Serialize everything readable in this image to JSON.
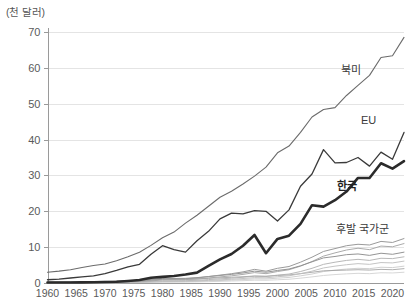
{
  "chart_data": {
    "type": "line",
    "title": "",
    "subtitle": "",
    "xlabel": "",
    "ylabel": "(천 달러)",
    "unit_note": "(천 달러)",
    "grid": true,
    "legend_position": "inline-annotations",
    "xlim": [
      1960,
      2022
    ],
    "ylim": [
      0,
      70
    ],
    "xticks": [
      1960,
      1965,
      1970,
      1975,
      1980,
      1985,
      1990,
      1995,
      2000,
      2005,
      2010,
      2015,
      2020
    ],
    "xtick_labels": [
      "1960",
      "1965",
      "1970",
      "1975",
      "1980",
      "1985",
      "1990",
      "1995",
      "2000",
      "2005",
      "2010",
      "2015",
      "2020"
    ],
    "yticks": [
      0,
      10,
      20,
      30,
      40,
      50,
      60,
      70
    ],
    "ytick_labels": [
      "0",
      "10",
      "20",
      "30",
      "40",
      "50",
      "60",
      "70"
    ],
    "x": [
      1960,
      1962,
      1964,
      1966,
      1968,
      1970,
      1972,
      1974,
      1976,
      1978,
      1980,
      1982,
      1984,
      1986,
      1988,
      1990,
      1992,
      1994,
      1996,
      1998,
      2000,
      2002,
      2004,
      2006,
      2008,
      2010,
      2012,
      2014,
      2016,
      2018,
      2020,
      2022
    ],
    "series": [
      {
        "name": "북미",
        "label": "북미",
        "color": "#6b6b6b",
        "width": 1.1,
        "style": "thin",
        "values": [
          3.0,
          3.3,
          3.7,
          4.3,
          4.9,
          5.3,
          6.2,
          7.3,
          8.6,
          10.5,
          12.6,
          14.2,
          16.7,
          18.9,
          21.4,
          23.9,
          25.6,
          27.6,
          29.8,
          32.3,
          36.3,
          38.2,
          42.0,
          46.3,
          48.4,
          48.9,
          52.3,
          55.1,
          57.9,
          62.9,
          63.4,
          68.5
        ]
      },
      {
        "name": "EU",
        "label": "EU",
        "color": "#3a3a3a",
        "width": 1.3,
        "style": "thin-dark",
        "values": [
          0.9,
          1.1,
          1.4,
          1.7,
          2.0,
          2.6,
          3.5,
          4.5,
          5.2,
          8.0,
          10.4,
          9.3,
          8.6,
          11.8,
          14.4,
          17.9,
          19.5,
          19.3,
          20.2,
          20.0,
          17.3,
          20.4,
          27.0,
          30.4,
          37.2,
          33.5,
          33.6,
          35.0,
          32.6,
          36.5,
          34.5,
          42.0
        ]
      },
      {
        "name": "한국",
        "label": "한국",
        "color": "#2b2b2b",
        "width": 2.6,
        "style": "bold",
        "values": [
          0.16,
          0.12,
          0.13,
          0.17,
          0.22,
          0.28,
          0.34,
          0.57,
          0.85,
          1.45,
          1.72,
          1.95,
          2.35,
          2.9,
          4.8,
          6.6,
          8.1,
          10.4,
          13.4,
          8.3,
          12.3,
          13.2,
          16.5,
          21.7,
          21.3,
          23.1,
          25.5,
          29.3,
          29.3,
          33.4,
          31.9,
          34.0
        ]
      },
      {
        "name": "후발 국가군",
        "label": "후발 국가군",
        "color": "#9a9a9a",
        "width": 1.0,
        "style": "thin-light",
        "values": [
          0.12,
          0.13,
          0.14,
          0.16,
          0.18,
          0.22,
          0.29,
          0.42,
          0.55,
          0.78,
          1.05,
          1.1,
          1.2,
          1.4,
          1.8,
          2.2,
          2.6,
          3.1,
          3.8,
          3.3,
          4.1,
          4.6,
          5.8,
          7.2,
          8.8,
          9.6,
          10.4,
          10.8,
          10.6,
          11.6,
          11.3,
          12.4
        ]
      },
      {
        "name": "후발 국가군 2",
        "label": "",
        "color": "#a5a5a5",
        "width": 0.95,
        "style": "thin-light",
        "values": [
          0.1,
          0.11,
          0.12,
          0.13,
          0.15,
          0.18,
          0.23,
          0.31,
          0.42,
          0.6,
          0.82,
          0.88,
          0.95,
          1.1,
          1.4,
          1.7,
          2.0,
          2.4,
          2.9,
          2.6,
          3.2,
          3.7,
          4.7,
          6.0,
          7.5,
          8.4,
          9.2,
          9.7,
          9.3,
          10.3,
          10.1,
          11.0
        ]
      },
      {
        "name": "후발 국가군 3",
        "label": "",
        "color": "#8e8e8e",
        "width": 0.95,
        "style": "thin-light",
        "values": [
          0.2,
          0.21,
          0.23,
          0.26,
          0.3,
          0.36,
          0.45,
          0.6,
          0.78,
          1.0,
          1.3,
          1.25,
          1.3,
          1.5,
          1.8,
          2.1,
          2.4,
          2.8,
          3.3,
          3.0,
          3.5,
          3.9,
          4.8,
          5.9,
          7.0,
          7.4,
          7.9,
          8.1,
          7.7,
          8.3,
          8.0,
          8.6
        ]
      },
      {
        "name": "후발 국가군 4",
        "label": "",
        "color": "#b0b0b0",
        "width": 0.9,
        "style": "thin-light",
        "values": [
          0.08,
          0.09,
          0.1,
          0.11,
          0.12,
          0.14,
          0.17,
          0.22,
          0.3,
          0.42,
          0.56,
          0.6,
          0.65,
          0.75,
          0.95,
          1.15,
          1.35,
          1.6,
          1.9,
          1.8,
          2.2,
          2.5,
          3.2,
          4.1,
          5.2,
          5.8,
          6.3,
          6.6,
          6.3,
          6.9,
          6.8,
          7.3
        ]
      },
      {
        "name": "후발 국가군 5",
        "label": "",
        "color": "#bdbdbd",
        "width": 0.9,
        "style": "thin-light",
        "values": [
          0.06,
          0.07,
          0.08,
          0.09,
          0.1,
          0.12,
          0.14,
          0.18,
          0.24,
          0.32,
          0.42,
          0.45,
          0.5,
          0.58,
          0.72,
          0.88,
          1.05,
          1.25,
          1.5,
          1.45,
          1.75,
          2.0,
          2.6,
          3.3,
          4.2,
          4.7,
          5.1,
          5.4,
          5.2,
          5.7,
          5.6,
          6.1
        ]
      },
      {
        "name": "후발 국가군 6",
        "label": "",
        "color": "#c8c8c8",
        "width": 0.85,
        "style": "thin-light",
        "values": [
          0.05,
          0.05,
          0.06,
          0.07,
          0.08,
          0.09,
          0.11,
          0.14,
          0.18,
          0.24,
          0.31,
          0.34,
          0.38,
          0.44,
          0.55,
          0.68,
          0.8,
          0.95,
          1.15,
          1.12,
          1.35,
          1.55,
          2.0,
          2.5,
          3.2,
          3.6,
          3.9,
          4.1,
          4.0,
          4.4,
          4.3,
          4.7
        ]
      },
      {
        "name": "후발 국가군 7",
        "label": "",
        "color": "#9f9f9f",
        "width": 0.85,
        "style": "thin-light",
        "values": [
          0.3,
          0.32,
          0.34,
          0.37,
          0.4,
          0.45,
          0.52,
          0.62,
          0.74,
          0.9,
          1.08,
          1.05,
          1.06,
          1.15,
          1.3,
          1.45,
          1.6,
          1.75,
          1.95,
          1.9,
          2.1,
          2.25,
          2.6,
          3.0,
          3.4,
          3.5,
          3.6,
          3.7,
          3.6,
          3.8,
          3.7,
          4.0
        ]
      },
      {
        "name": "후발 국가군 8",
        "label": "",
        "color": "#d0d0d0",
        "width": 0.85,
        "style": "thin-light",
        "values": [
          0.04,
          0.04,
          0.05,
          0.05,
          0.06,
          0.07,
          0.08,
          0.1,
          0.13,
          0.17,
          0.22,
          0.24,
          0.26,
          0.3,
          0.38,
          0.46,
          0.55,
          0.65,
          0.78,
          0.76,
          0.9,
          1.05,
          1.35,
          1.7,
          2.1,
          2.35,
          2.55,
          2.7,
          2.6,
          2.85,
          2.8,
          3.0
        ]
      }
    ],
    "annotations": [
      {
        "text": "북미",
        "x_px": 341,
        "y_px": 74,
        "bold": false
      },
      {
        "text": "EU",
        "x_px": 361,
        "y_px": 124,
        "bold": false
      },
      {
        "text": "한국",
        "x_px": 337,
        "y_px": 190,
        "bold": true
      },
      {
        "text": "후발 국가군",
        "x_px": 336,
        "y_px": 233,
        "bold": false
      }
    ]
  }
}
